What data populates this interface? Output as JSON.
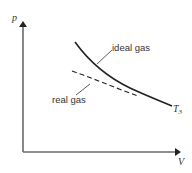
{
  "diagram": {
    "title": "",
    "axes": {
      "y_label": "p",
      "x_label": "V"
    },
    "curves": [
      {
        "name": "ideal gas",
        "style": "solid",
        "label": "ideal gas"
      },
      {
        "name": "real gas",
        "style": "dashed",
        "label": "real gas"
      }
    ],
    "isotherm_label": {
      "main": "T",
      "subscript": "3"
    },
    "colors": {
      "axis": "#555555",
      "curve": "#222222",
      "text": "#333333"
    }
  }
}
